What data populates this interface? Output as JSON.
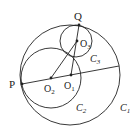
{
  "diagram": {
    "points": {
      "P": "P",
      "Q": "Q",
      "O1": "O",
      "O2": "O",
      "O3": "O"
    },
    "subscripts": {
      "O1": "1",
      "O2": "2",
      "O3": "3",
      "C1": "1",
      "C2": "2",
      "C3": "3"
    },
    "circles": {
      "C1": "C",
      "C2": "C",
      "C3": "C"
    },
    "colors": {
      "stroke": "#222222",
      "background": "#ffffff"
    }
  }
}
